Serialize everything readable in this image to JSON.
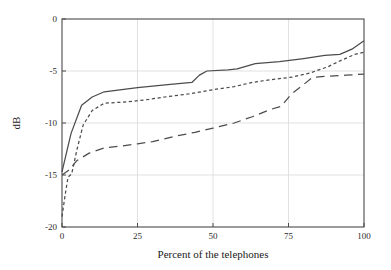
{
  "chart_data": {
    "type": "line",
    "title": "",
    "xlabel": "Percent of the telephones",
    "ylabel": "dB",
    "xlim": [
      0,
      100
    ],
    "ylim": [
      -20,
      0
    ],
    "xticks": [
      0,
      25,
      50,
      75,
      100
    ],
    "yticks": [
      0,
      -5,
      -10,
      -15,
      -20
    ],
    "xtick_labels": [
      "0",
      "25",
      "50",
      "75",
      "100"
    ],
    "ytick_labels": [
      "0",
      "-5",
      "-10",
      "-15",
      "-20"
    ],
    "grid": true,
    "legend": "none",
    "series": [
      {
        "name": "solid-upper",
        "style": "solid",
        "color": "#4c4c4c",
        "x": [
          0,
          1.2,
          3.0,
          6.5,
          10.0,
          14.0,
          25.0,
          35.0,
          43.0,
          45.5,
          48.0,
          55.0,
          58.0,
          64.0,
          72.0,
          80.0,
          87.0,
          92.0,
          96.0,
          100.0
        ],
        "y": [
          -14.7,
          -13.2,
          -11.0,
          -8.3,
          -7.5,
          -7.0,
          -6.6,
          -6.3,
          -6.1,
          -5.4,
          -5.0,
          -4.9,
          -4.8,
          -4.3,
          -4.1,
          -3.8,
          -3.5,
          -3.4,
          -2.9,
          -2.1
        ]
      },
      {
        "name": "dotted-middle",
        "style": "dotted",
        "color": "#4c4c4c",
        "x": [
          0,
          1.0,
          2.0,
          3.2,
          5.0,
          7.0,
          10.0,
          14.0,
          20.0,
          27.0,
          34.0,
          42.0,
          50.0,
          57.0,
          63.0,
          70.0,
          76.0,
          82.0,
          88.0,
          93.0,
          97.0,
          100.0
        ],
        "y": [
          -19.0,
          -17.0,
          -15.2,
          -14.9,
          -12.5,
          -10.2,
          -8.8,
          -8.1,
          -8.0,
          -7.8,
          -7.5,
          -7.2,
          -6.8,
          -6.5,
          -6.1,
          -5.8,
          -5.6,
          -5.2,
          -4.6,
          -3.9,
          -3.4,
          -3.2
        ]
      },
      {
        "name": "dashed-lower",
        "style": "dashed",
        "color": "#4c4c4c",
        "x": [
          0,
          2.0,
          5.0,
          9.0,
          14.0,
          20.0,
          25.0,
          30.0,
          37.0,
          44.0,
          50.0,
          57.0,
          63.0,
          69.0,
          72.5,
          76.0,
          80.0,
          83.0,
          88.0,
          94.0,
          100.0
        ],
        "y": [
          -15.0,
          -14.6,
          -13.6,
          -12.9,
          -12.4,
          -12.2,
          -12.0,
          -11.8,
          -11.3,
          -10.9,
          -10.5,
          -10.0,
          -9.4,
          -8.7,
          -8.4,
          -7.2,
          -6.3,
          -5.6,
          -5.5,
          -5.4,
          -5.3
        ]
      }
    ]
  },
  "figure": {
    "plot_area": {
      "left": 62,
      "top": 19,
      "right": 364,
      "bottom": 227
    }
  }
}
